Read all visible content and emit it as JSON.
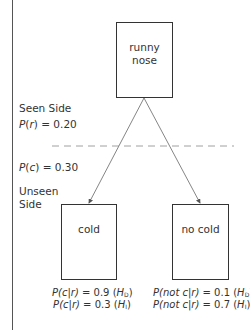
{
  "nodes": {
    "root": {
      "line1": "runny",
      "line2": "nose"
    },
    "left": {
      "label": "cold"
    },
    "right": {
      "label": "no cold"
    }
  },
  "side_labels": {
    "seen": "Seen Side",
    "p_r_func": "P",
    "p_r_var": "r",
    "p_r_value": " = 0.20",
    "p_c_func": "P",
    "p_c_var": "c",
    "p_c_value": " = 0.30",
    "unseen_line1": "Unseen",
    "unseen_line2": "Side"
  },
  "probabilities": {
    "left": [
      {
        "expr": "P(c|r)",
        "value": " = 0.9 (",
        "hyp": "H",
        "sub": "D",
        "close": ")"
      },
      {
        "expr": "P(c|r)",
        "value": " = 0.3 (",
        "hyp": "H",
        "sub": "I",
        "close": ")"
      }
    ],
    "right": [
      {
        "expr": "P(not c|r)",
        "value": " = 0.1 (",
        "hyp": "H",
        "sub": "D",
        "close": ")"
      },
      {
        "expr": "P(not c|r)",
        "value": " = 0.7 (",
        "hyp": "H",
        "sub": "I",
        "close": ")"
      }
    ]
  }
}
